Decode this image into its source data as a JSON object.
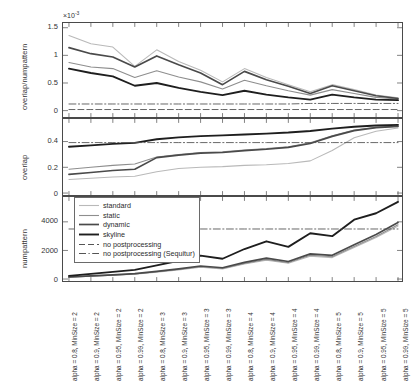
{
  "figure": {
    "title": "",
    "panel_count": 3
  },
  "legend": {
    "position": "bottom-left-inside-numpattern-panel",
    "entries": [
      {
        "label": "standard",
        "color": "#b9b9b9",
        "style": "solid",
        "width": 1.1
      },
      {
        "label": "static",
        "color": "#8e8e8e",
        "style": "solid",
        "width": 1.1
      },
      {
        "label": "dynamic",
        "color": "#4a4a4a",
        "style": "solid",
        "width": 1.7
      },
      {
        "label": "skyline",
        "color": "#1e1e1e",
        "style": "solid",
        "width": 1.9
      },
      {
        "label": "no postprocessing",
        "color": "#555555",
        "style": "dashed",
        "width": 1.0
      },
      {
        "label": "no postprocessing (Sequitur)",
        "color": "#555555",
        "style": "dashdot",
        "width": 1.0
      }
    ]
  },
  "xaxis": {
    "categories": [
      "alpha = 0.8, MinSize = 2",
      "alpha = 0.9, MinSize = 2",
      "alpha = 0.95, MinSize = 2",
      "alpha = 0.99, MinSize = 2",
      "alpha = 0.8, MinSize = 3",
      "alpha = 0.9, MinSize = 3",
      "alpha = 0.95, MinSize = 3",
      "alpha = 0.99, MinSize = 3",
      "alpha = 0.8, MinSize = 4",
      "alpha = 0.9, MinSize = 4",
      "alpha = 0.95, MinSize = 4",
      "alpha = 0.99, MinSize = 4",
      "alpha = 0.8, MinSize = 5",
      "alpha = 0.9, MinSize = 5",
      "alpha = 0.95, MinSize = 5",
      "alpha = 0.99, MinSize = 5"
    ],
    "rotation": 90
  },
  "chart_data": [
    {
      "type": "line",
      "panel": "top",
      "title": "",
      "xlabel": "",
      "ylabel": "overlap/numpattern",
      "yticks": [
        0,
        0.5,
        1,
        1.5
      ],
      "ytick_labels": [
        "0",
        "0.5",
        "1",
        "1.5"
      ],
      "ylim": [
        -0.08,
        1.55
      ],
      "y_exponent": "×10",
      "y_exponent_sup": "-3",
      "grid": false,
      "x": [
        1,
        2,
        3,
        4,
        5,
        6,
        7,
        8,
        9,
        10,
        11,
        12,
        13,
        14,
        15,
        16
      ],
      "series": [
        {
          "name": "standard",
          "color": "#b9b9b9",
          "values": [
            1.36,
            1.21,
            1.15,
            0.8,
            1.1,
            0.89,
            0.73,
            0.52,
            0.76,
            0.6,
            0.47,
            0.34,
            0.47,
            0.38,
            0.28,
            0.23
          ]
        },
        {
          "name": "static",
          "color": "#8e8e8e",
          "values": [
            0.87,
            0.79,
            0.76,
            0.6,
            0.72,
            0.61,
            0.52,
            0.39,
            0.55,
            0.45,
            0.36,
            0.28,
            0.38,
            0.31,
            0.24,
            0.21
          ]
        },
        {
          "name": "dynamic",
          "color": "#4a4a4a",
          "values": [
            1.14,
            1.03,
            0.97,
            0.79,
            0.99,
            0.83,
            0.68,
            0.47,
            0.71,
            0.56,
            0.44,
            0.31,
            0.45,
            0.36,
            0.27,
            0.22
          ]
        },
        {
          "name": "skyline",
          "color": "#1e1e1e",
          "values": [
            0.76,
            0.68,
            0.62,
            0.45,
            0.5,
            0.41,
            0.34,
            0.28,
            0.36,
            0.29,
            0.24,
            0.2,
            0.29,
            0.24,
            0.2,
            0.19
          ]
        },
        {
          "name": "no postprocessing",
          "color": "#555555",
          "style": "dashed",
          "values": [
            0.02,
            0.02,
            0.02,
            0.02,
            0.02,
            0.02,
            0.02,
            0.02,
            0.02,
            0.02,
            0.02,
            0.02,
            0.02,
            0.02,
            0.02,
            0.02
          ]
        },
        {
          "name": "no postprocessing (Sequitur)",
          "color": "#555555",
          "style": "dashdot",
          "values": [
            0.12,
            0.12,
            0.12,
            0.12,
            0.12,
            0.12,
            0.12,
            0.12,
            0.12,
            0.12,
            0.12,
            0.13,
            0.13,
            0.13,
            0.13,
            0.13
          ]
        }
      ]
    },
    {
      "type": "line",
      "panel": "middle",
      "title": "",
      "xlabel": "",
      "ylabel": "overlap",
      "yticks": [
        0,
        0.2,
        0.4
      ],
      "ytick_labels": [
        "0",
        "0.2",
        "0.4"
      ],
      "ylim": [
        0,
        0.56
      ],
      "grid": false,
      "x": [
        1,
        2,
        3,
        4,
        5,
        6,
        7,
        8,
        9,
        10,
        11,
        12,
        13,
        14,
        15,
        16
      ],
      "series": [
        {
          "name": "standard",
          "color": "#b9b9b9",
          "values": [
            0.105,
            0.115,
            0.125,
            0.13,
            0.165,
            0.19,
            0.2,
            0.205,
            0.215,
            0.22,
            0.23,
            0.25,
            0.33,
            0.43,
            0.48,
            0.505
          ]
        },
        {
          "name": "static",
          "color": "#8e8e8e",
          "values": [
            0.185,
            0.2,
            0.215,
            0.225,
            0.28,
            0.3,
            0.315,
            0.32,
            0.335,
            0.345,
            0.36,
            0.39,
            0.445,
            0.49,
            0.51,
            0.52
          ]
        },
        {
          "name": "dynamic",
          "color": "#4a4a4a",
          "values": [
            0.145,
            0.16,
            0.175,
            0.185,
            0.275,
            0.295,
            0.31,
            0.315,
            0.33,
            0.34,
            0.355,
            0.385,
            0.44,
            0.485,
            0.508,
            0.518
          ]
        },
        {
          "name": "skyline",
          "color": "#1e1e1e",
          "values": [
            0.36,
            0.37,
            0.382,
            0.39,
            0.418,
            0.432,
            0.442,
            0.448,
            0.455,
            0.462,
            0.47,
            0.482,
            0.5,
            0.515,
            0.525,
            0.53
          ]
        },
        {
          "name": "no postprocessing",
          "color": "#555555",
          "style": "dashdot",
          "values": [
            0.392,
            0.392,
            0.392,
            0.392,
            0.392,
            0.392,
            0.392,
            0.392,
            0.392,
            0.392,
            0.392,
            0.392,
            0.392,
            0.392,
            0.392,
            0.392
          ]
        }
      ]
    },
    {
      "type": "line",
      "panel": "bottom",
      "title": "",
      "xlabel": "",
      "ylabel": "numpattern",
      "yticks": [
        0,
        2000,
        4000
      ],
      "ytick_labels": [
        "0",
        "2000",
        "4000"
      ],
      "ylim": [
        0,
        5600
      ],
      "grid": false,
      "x": [
        1,
        2,
        3,
        4,
        5,
        6,
        7,
        8,
        9,
        10,
        11,
        12,
        13,
        14,
        15,
        16
      ],
      "series": [
        {
          "name": "standard",
          "color": "#b9b9b9",
          "values": [
            120,
            190,
            260,
            330,
            480,
            640,
            820,
            700,
            1050,
            1320,
            1100,
            1600,
            1500,
            2200,
            2900,
            3700
          ]
        },
        {
          "name": "static",
          "color": "#8e8e8e",
          "values": [
            130,
            205,
            275,
            350,
            505,
            670,
            855,
            735,
            1095,
            1375,
            1150,
            1660,
            1560,
            2270,
            2980,
            3800
          ]
        },
        {
          "name": "dynamic",
          "color": "#4a4a4a",
          "values": [
            140,
            220,
            295,
            375,
            540,
            715,
            910,
            790,
            1165,
            1460,
            1225,
            1760,
            1660,
            2390,
            3120,
            3960
          ]
        },
        {
          "name": "skyline",
          "color": "#1e1e1e",
          "values": [
            220,
            360,
            500,
            640,
            950,
            1280,
            1640,
            1420,
            2100,
            2640,
            2250,
            3200,
            3000,
            4150,
            4600,
            5400
          ]
        },
        {
          "name": "no postprocessing",
          "color": "#555555",
          "style": "dashdot",
          "values": [
            3500,
            3500,
            3500,
            3500,
            3500,
            3500,
            3500,
            3500,
            3500,
            3500,
            3500,
            3500,
            3500,
            3500,
            3500,
            3500
          ]
        }
      ]
    }
  ]
}
